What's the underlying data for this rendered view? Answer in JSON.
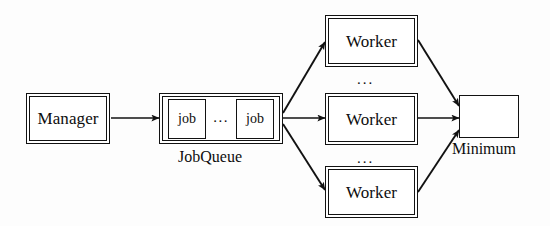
{
  "diagram": {
    "type": "architecture-flow-diagram",
    "canvas": {
      "width": 550,
      "height": 226,
      "background": "#fdfdfd"
    },
    "ink_color": "#121212",
    "nodes": {
      "manager": {
        "label": "Manager",
        "style": "double-border"
      },
      "jobqueue": {
        "caption": "JobQueue",
        "style": "double-border",
        "cells": [
          {
            "label": "job"
          },
          {
            "label": "job"
          }
        ],
        "cell_ellipsis": "..."
      },
      "workers": [
        {
          "label": "Worker",
          "style": "double-border",
          "position": "top"
        },
        {
          "label": "Worker",
          "style": "double-border",
          "position": "middle"
        },
        {
          "label": "Worker",
          "style": "double-border",
          "position": "bottom"
        }
      ],
      "worker_ellipses": [
        "...",
        "..."
      ],
      "minimum": {
        "caption": "Minimum",
        "label": "",
        "style": "single-border"
      }
    },
    "edges": [
      {
        "from": "manager",
        "to": "jobqueue",
        "arrow": "single",
        "direction": "right"
      },
      {
        "from": "jobqueue",
        "to": "worker-top",
        "arrow": "single",
        "direction": "up-right"
      },
      {
        "from": "jobqueue",
        "to": "worker-middle",
        "arrow": "single",
        "direction": "right"
      },
      {
        "from": "jobqueue",
        "to": "worker-bottom",
        "arrow": "single",
        "direction": "down-right"
      },
      {
        "from": "worker-top",
        "to": "minimum",
        "arrow": "double",
        "direction": "bidirectional"
      },
      {
        "from": "worker-middle",
        "to": "minimum",
        "arrow": "double",
        "direction": "bidirectional"
      },
      {
        "from": "worker-bottom",
        "to": "minimum",
        "arrow": "double",
        "direction": "bidirectional"
      }
    ]
  }
}
